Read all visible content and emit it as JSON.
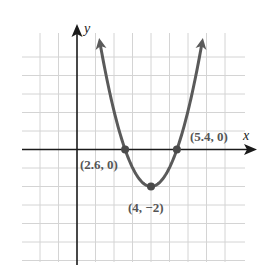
{
  "chart_data": {
    "type": "line",
    "title": "",
    "xlabel": "x",
    "ylabel": "y",
    "function": "parabola opening upward, vertex (4, -2), x-intercepts (2.6, 0) and (5.4, 0)",
    "xlim": [
      -3,
      9
    ],
    "ylim": [
      -6,
      6
    ],
    "grid": true,
    "grid_step": 1,
    "series": [
      {
        "name": "parabola",
        "x": [
          1.2,
          1.6,
          2.0,
          2.6,
          3.0,
          3.5,
          4.0,
          4.5,
          5.0,
          5.4,
          6.0,
          6.4,
          6.8
        ],
        "y": [
          6.0,
          3.87,
          2.08,
          0.0,
          -0.98,
          -1.74,
          -2.0,
          -1.74,
          -0.98,
          0.0,
          2.08,
          3.87,
          6.0
        ]
      }
    ],
    "points": [
      {
        "label": "(2.6, 0)",
        "x": 2.6,
        "y": 0
      },
      {
        "label": "(4, −2)",
        "x": 4,
        "y": -2
      },
      {
        "label": "(5.4, 0)",
        "x": 5.4,
        "y": 0
      }
    ]
  },
  "labels": {
    "x_axis": "x",
    "y_axis": "y",
    "left_intercept": "(2.6, 0)",
    "vertex": "(4, −2)",
    "right_intercept": "(5.4, 0)"
  },
  "colors": {
    "grid": "#d4d4d4",
    "axis": "#1a1a1a",
    "curve": "#5a5a5a",
    "point": "#4a4a4a",
    "label": "#555555"
  }
}
